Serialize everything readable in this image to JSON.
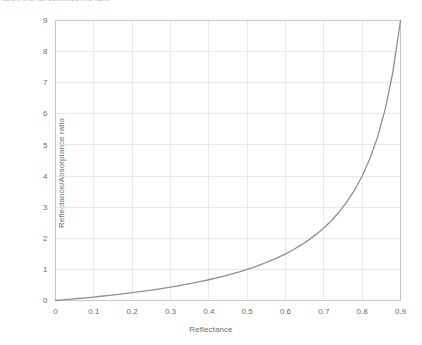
{
  "caption": {
    "text": "below it is not combined into ratio"
  },
  "chart_data": {
    "type": "line",
    "title": "",
    "xlabel": "Reflectance",
    "ylabel": "Reflectance/Absorptance ratio",
    "xlim": [
      0,
      0.9
    ],
    "ylim": [
      0,
      9
    ],
    "grid": true,
    "legend": null,
    "line_color": "#8f8f91",
    "grid_color": "#e4e4e6",
    "frame_color": "#c9c9cc",
    "xticks": [
      "0",
      "0.1",
      "0.2",
      "0.3",
      "0.4",
      "0.5",
      "0.6",
      "0.7",
      "0.8",
      "0.9"
    ],
    "xtick_values": [
      0,
      0.1,
      0.2,
      0.3,
      0.4,
      0.5,
      0.6,
      0.7,
      0.8,
      0.9
    ],
    "yticks": [
      "0",
      "1",
      "2",
      "3",
      "4",
      "5",
      "6",
      "7",
      "8",
      "9"
    ],
    "ytick_values": [
      0,
      1,
      2,
      3,
      4,
      5,
      6,
      7,
      8,
      9
    ],
    "series": [
      {
        "name": "Reflectance/Absorptance ratio",
        "formula": "R / (1 - R)",
        "x": [
          0,
          0.02,
          0.04,
          0.06,
          0.08,
          0.1,
          0.12,
          0.14,
          0.16,
          0.18,
          0.2,
          0.22,
          0.24,
          0.26,
          0.28,
          0.3,
          0.32,
          0.34,
          0.36,
          0.38,
          0.4,
          0.42,
          0.44,
          0.46,
          0.48,
          0.5,
          0.52,
          0.54,
          0.56,
          0.58,
          0.6,
          0.62,
          0.64,
          0.66,
          0.68,
          0.7,
          0.72,
          0.74,
          0.76,
          0.78,
          0.8,
          0.82,
          0.84,
          0.86,
          0.88,
          0.9
        ],
        "values": [
          0,
          0.02,
          0.042,
          0.064,
          0.087,
          0.111,
          0.136,
          0.163,
          0.19,
          0.22,
          0.25,
          0.282,
          0.316,
          0.351,
          0.389,
          0.429,
          0.471,
          0.515,
          0.563,
          0.613,
          0.667,
          0.724,
          0.786,
          0.852,
          0.923,
          1.0,
          1.083,
          1.174,
          1.273,
          1.381,
          1.5,
          1.632,
          1.778,
          1.941,
          2.125,
          2.333,
          2.571,
          2.846,
          3.167,
          3.545,
          4.0,
          4.556,
          5.25,
          6.143,
          7.333,
          9.0
        ]
      }
    ]
  }
}
